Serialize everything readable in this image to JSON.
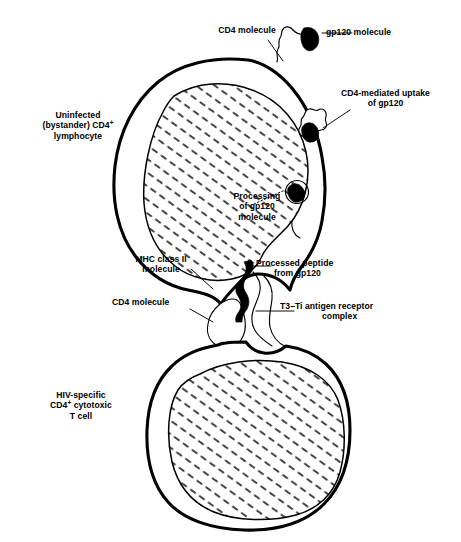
{
  "figure": {
    "kind": "biology-schematic",
    "line_color": "#000000",
    "fill_color": "#ffffff",
    "background": "#ffffff"
  },
  "labels": {
    "uninfected_lymphocyte": {
      "line1": "Uninfected",
      "line2_pre": "(bystander) CD4",
      "line2_sup": "+",
      "line3": "lymphocyte"
    },
    "cd4_molecule_top": "CD4 molecule",
    "gp120_molecule": "gp120 molecule",
    "cd4_mediated_uptake": {
      "line1": "CD4-mediated uptake",
      "line2": "of gp120"
    },
    "processing_of_gp120": {
      "line1": "Processing",
      "line2": "of gp120",
      "line3": "molecule"
    },
    "mhc_class_ii": {
      "line1": "MHC class II",
      "line2": "molecule"
    },
    "processed_peptide": {
      "line1": "Processed peptide",
      "line2": "from gp120"
    },
    "cd4_molecule_bottom": "CD4 molecule",
    "t3_ti_receptor": {
      "line1": "T3–Ti antigen receptor",
      "line2": "complex"
    },
    "hiv_specific_t_cell": {
      "line1": "HIV-specific",
      "line2_pre": "CD4",
      "line2_sup": "+",
      "line2_post": " cytotoxic",
      "line3": "T cell"
    }
  },
  "structures": {
    "upper_cell": "uninfected bystander CD4+ lymphocyte",
    "upper_nucleus": "hatched nucleus of bystander lymphocyte",
    "lower_cell": "HIV-specific CD4+ cytotoxic T cell",
    "lower_nucleus": "hatched nucleus of cytotoxic T cell",
    "gp120_free": "free gp120 molecule (solid black wedge)",
    "gp120_bound": "gp120 engulfed by CD4 receptor",
    "gp120_endosome": "gp120 inside processing endosome",
    "cd4_receptor_top": "CD4 receptor at upper membrane",
    "cd4_receptor_uptake": "CD4 receptor performing uptake",
    "mhc_class_ii_molecule": "MHC class II molecule on presenting cell",
    "processed_peptide_strip": "processed gp120 peptide (solid black zigzag)",
    "t3_ti_complex": "T3-Ti antigen receptor complex on T cell",
    "cd4_molecule_t_cell": "CD4 molecule on cytotoxic T cell"
  }
}
